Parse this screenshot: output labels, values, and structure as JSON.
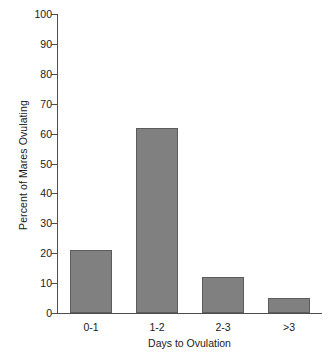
{
  "chart_data": {
    "type": "bar",
    "title": "",
    "xlabel": "Days to Ovulation",
    "ylabel": "Percent of Mares Ovulating",
    "categories": [
      "0-1",
      "1-2",
      "2-3",
      ">3"
    ],
    "values": [
      21,
      62,
      12,
      5
    ],
    "ylim": [
      0,
      100
    ],
    "yticks": [
      0,
      10,
      20,
      30,
      40,
      50,
      60,
      70,
      80,
      90,
      100
    ],
    "ytick_labels": [
      "0",
      "10",
      "20",
      "30",
      "40",
      "50",
      "60",
      "70",
      "80",
      "90",
      "100"
    ],
    "grid": false,
    "legend": null,
    "bar_color": "#808080",
    "bar_edge_color": "#5c5c5c",
    "axis_color": "#4d4d4d",
    "background": "#ffffff"
  }
}
